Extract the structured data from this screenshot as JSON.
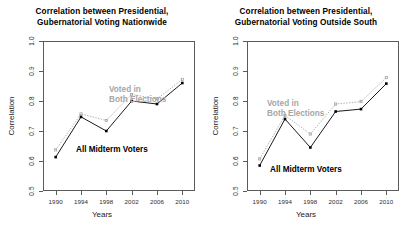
{
  "figure": {
    "background": "#ffffff",
    "series_colors": {
      "all_midterm_voters": "#000000",
      "voted_both_elections": "#9a9a9a"
    }
  },
  "panels": [
    {
      "id": "nationwide",
      "title_line1": "Correlation between Presidential,",
      "title_line2": "Gubernatorial Voting Nationwide",
      "xlabel": "Years",
      "ylabel": "Correlation",
      "annotation_gray_line1": "Voted in",
      "annotation_gray_line2": "Both Elections",
      "annotation_black": "All Midterm Voters"
    },
    {
      "id": "outside-south",
      "title_line1": "Correlation between Presidential,",
      "title_line2": "Gubernatorial Voting Outside South",
      "xlabel": "Years",
      "ylabel": "Correlation",
      "annotation_gray_line1": "Voted in",
      "annotation_gray_line2": "Both Elections",
      "annotation_black": "All Midterm Voters"
    }
  ],
  "chart_data": [
    {
      "type": "line",
      "title": "Correlation between Presidential, Gubernatorial Voting Nationwide",
      "xlabel": "Years",
      "ylabel": "Correlation",
      "x": [
        1990,
        1994,
        1998,
        2002,
        2006,
        2010
      ],
      "xtick_labels": [
        "1990",
        "1994",
        "1998",
        "2002",
        "2006",
        "2010"
      ],
      "ytick_labels": [
        "0.5",
        "0.6",
        "0.7",
        "0.8",
        "0.9",
        "1.0"
      ],
      "yticks": [
        0.5,
        0.6,
        0.7,
        0.8,
        0.9,
        1.0
      ],
      "xlim": [
        1988,
        2012
      ],
      "ylim": [
        0.5,
        1.0
      ],
      "grid": false,
      "legend": "in-plot annotations",
      "series": [
        {
          "name": "All Midterm Voters",
          "color": "#000000",
          "linestyle": "solid",
          "marker": "filled-square",
          "values": [
            0.613,
            0.747,
            0.7,
            0.8,
            0.79,
            0.86
          ]
        },
        {
          "name": "Voted in Both Elections",
          "color": "#9a9a9a",
          "linestyle": "dotted",
          "marker": "open-square",
          "values": [
            0.637,
            0.757,
            0.735,
            0.822,
            0.807,
            0.872
          ]
        }
      ]
    },
    {
      "type": "line",
      "title": "Correlation between Presidential, Gubernatorial Voting Outside South",
      "xlabel": "Years",
      "ylabel": "Correlation",
      "x": [
        1990,
        1994,
        1998,
        2002,
        2006,
        2010
      ],
      "xtick_labels": [
        "1990",
        "1994",
        "1998",
        "2002",
        "2006",
        "2010"
      ],
      "ytick_labels": [
        "0.5",
        "0.6",
        "0.7",
        "0.8",
        "0.9",
        "1.0"
      ],
      "yticks": [
        0.5,
        0.6,
        0.7,
        0.8,
        0.9,
        1.0
      ],
      "xlim": [
        1988,
        2012
      ],
      "ylim": [
        0.5,
        1.0
      ],
      "grid": false,
      "legend": "in-plot annotations",
      "series": [
        {
          "name": "All Midterm Voters",
          "color": "#000000",
          "linestyle": "solid",
          "marker": "filled-square",
          "values": [
            0.585,
            0.74,
            0.645,
            0.765,
            0.773,
            0.858
          ]
        },
        {
          "name": "Voted in Both Elections",
          "color": "#9a9a9a",
          "linestyle": "dotted",
          "marker": "open-square",
          "values": [
            0.607,
            0.752,
            0.69,
            0.79,
            0.798,
            0.878
          ]
        }
      ]
    }
  ]
}
